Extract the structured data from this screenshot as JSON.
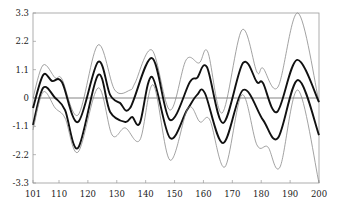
{
  "chart_data": {
    "type": "line",
    "title": "",
    "xlabel": "",
    "ylabel": "",
    "xlim": [
      101,
      200
    ],
    "ylim": [
      -3.3,
      3.3
    ],
    "x_ticks": [
      101,
      110,
      120,
      130,
      140,
      150,
      160,
      170,
      180,
      190,
      200
    ],
    "x_tick_labels": [
      "101",
      "110",
      "120",
      "130",
      "140",
      "150",
      "160",
      "170",
      "180",
      "190",
      "200"
    ],
    "y_ticks": [
      3.3,
      2.2,
      1.1,
      0,
      -1.1,
      -2.2,
      -3.3
    ],
    "y_tick_labels": [
      "3.3",
      "2.2",
      "1.1",
      "0",
      "-1.1",
      "-2.2",
      "-3.3"
    ],
    "grid": false,
    "zero_line": true,
    "legend": null,
    "series": [
      {
        "name": "upper-band-outer",
        "style": "thin",
        "color": "#8a8a8a",
        "x": [
          101,
          104.5,
          108.7,
          111.0,
          116.6,
          123.5,
          129.3,
          134.6,
          136.3,
          142.2,
          148.4,
          154.0,
          158.5,
          161.5,
          166.5,
          173.3,
          178.5,
          180.6,
          185.8,
          192.7,
          200
        ],
        "y": [
          0.0,
          1.28,
          0.78,
          0.74,
          -0.66,
          2.06,
          0.31,
          0.31,
          0.58,
          1.86,
          -0.47,
          1.48,
          1.36,
          1.79,
          -0.58,
          2.64,
          1.01,
          1.16,
          0.43,
          3.3,
          -0.16
        ]
      },
      {
        "name": "upper-band-mean",
        "style": "thick",
        "color": "#111111",
        "x": [
          101,
          104.5,
          107.6,
          111.0,
          116.6,
          123.5,
          127.7,
          131.1,
          134.6,
          142.2,
          148.4,
          155.3,
          157.8,
          161.2,
          166.8,
          173.7,
          178.5,
          180.6,
          185.5,
          192.4,
          200
        ],
        "y": [
          -0.39,
          0.89,
          0.66,
          0.62,
          -0.93,
          1.4,
          0.12,
          -0.19,
          -0.39,
          1.55,
          -0.85,
          0.62,
          0.78,
          1.2,
          -0.97,
          1.36,
          0.62,
          0.58,
          -0.54,
          1.48,
          -0.16
        ]
      },
      {
        "name": "lower-band-mean",
        "style": "thick",
        "color": "#111111",
        "x": [
          101,
          104.5,
          108.7,
          112.1,
          116.6,
          123.5,
          127.7,
          132.9,
          135.3,
          138.0,
          142.2,
          148.4,
          154.3,
          157.8,
          160.5,
          166.8,
          173.7,
          180.6,
          185.8,
          192.7,
          200
        ],
        "y": [
          -1.05,
          0.39,
          0.0,
          -0.47,
          -1.94,
          0.89,
          -0.54,
          -0.93,
          -0.74,
          -0.97,
          0.82,
          -1.55,
          -0.47,
          0.12,
          0.19,
          -1.75,
          0.31,
          -0.85,
          -1.55,
          0.7,
          -1.44
        ]
      },
      {
        "name": "lower-band-outer",
        "style": "thin",
        "color": "#8a8a8a",
        "x": [
          101,
          104.5,
          108.7,
          112.1,
          116.6,
          123.5,
          128.4,
          132.9,
          138.0,
          142.6,
          148.4,
          154.7,
          158.8,
          162.2,
          167.4,
          173.3,
          178.5,
          182.3,
          186.5,
          192.7,
          200
        ],
        "y": [
          -1.24,
          0.23,
          -0.39,
          -0.78,
          -2.1,
          0.39,
          -1.44,
          -1.16,
          -1.63,
          0.51,
          -2.41,
          -0.39,
          -0.93,
          -0.85,
          -2.68,
          0.12,
          -1.82,
          -1.9,
          -2.68,
          0.31,
          -3.3
        ]
      }
    ]
  }
}
